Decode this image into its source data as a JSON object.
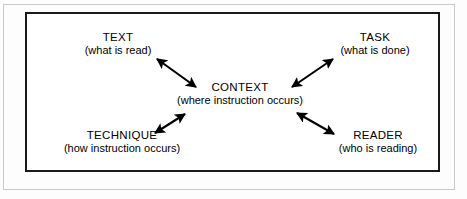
{
  "diagram": {
    "type": "concept-map",
    "center": {
      "id": "context",
      "title": "CONTEXT",
      "subtitle": "(where instruction occurs)"
    },
    "nodes": [
      {
        "id": "text",
        "title": "TEXT",
        "subtitle": "(what is read)",
        "position": "upper-left"
      },
      {
        "id": "task",
        "title": "TASK",
        "subtitle": "(what is done)",
        "position": "upper-right"
      },
      {
        "id": "technique",
        "title": "TECHNIQUE",
        "subtitle": "(how instruction occurs)",
        "position": "lower-left"
      },
      {
        "id": "reader",
        "title": "READER",
        "subtitle": "(who is reading)",
        "position": "lower-right"
      }
    ],
    "connectors": [
      {
        "id": "context-text",
        "from": "context",
        "to": "text",
        "style": "double-headed-arrow"
      },
      {
        "id": "context-task",
        "from": "context",
        "to": "task",
        "style": "double-headed-arrow"
      },
      {
        "id": "context-technique",
        "from": "context",
        "to": "technique",
        "style": "double-headed-arrow"
      },
      {
        "id": "context-reader",
        "from": "context",
        "to": "reader",
        "style": "double-headed-arrow"
      }
    ],
    "colors": {
      "ink": "#000000",
      "border": "#1a1a1a",
      "outer_frame": "#c9c9c9",
      "background": "#ffffff"
    }
  }
}
